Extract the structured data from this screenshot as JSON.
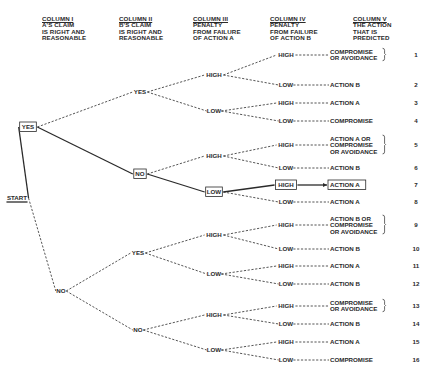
{
  "columns": [
    {
      "title": "COLUMN I",
      "lines": [
        "A'S CLAIM",
        "IS RIGHT AND",
        "REASONABLE"
      ],
      "x": 57
    },
    {
      "title": "COLUMN II",
      "lines": [
        "B'S CLAIM",
        "IS RIGHT AND",
        "REASONABLE"
      ],
      "x": 133
    },
    {
      "title": "COLUMN III",
      "lines": [
        "PENALTY",
        "FROM FAILURE",
        "OF ACTION A"
      ],
      "x": 206
    },
    {
      "title": "COLUMN IV",
      "lines": [
        "PENALTY",
        "FROM FAILURE",
        "OF ACTION B"
      ],
      "x": 286
    },
    {
      "title": "COLUMN V",
      "lines": [
        "THE ACTION",
        "THAT IS",
        "PREDICTED"
      ],
      "x": 354
    }
  ],
  "colors": {
    "ink": "#2a2a2a",
    "background": "#ffffff"
  },
  "nodes": {
    "start": {
      "label": "START",
      "x": 17,
      "y": 198,
      "boxed": false,
      "underline": true
    },
    "c1_yes": {
      "label": "YES",
      "x": 28,
      "y": 127,
      "boxed": true
    },
    "c1_no": {
      "label": "NO",
      "x": 61,
      "y": 291,
      "boxed": false
    },
    "c2_yy": {
      "label": "YES",
      "x": 140,
      "y": 92,
      "boxed": false
    },
    "c2_yn": {
      "label": "NO",
      "x": 140,
      "y": 174,
      "boxed": true
    },
    "c2_ny": {
      "label": "YES",
      "x": 138,
      "y": 253,
      "boxed": false
    },
    "c2_nn": {
      "label": "NO",
      "x": 138,
      "y": 330,
      "boxed": false
    },
    "c3_1": {
      "label": "HIGH",
      "x": 214,
      "y": 75,
      "boxed": false
    },
    "c3_2": {
      "label": "LOW",
      "x": 214,
      "y": 111,
      "boxed": false
    },
    "c3_3": {
      "label": "HIGH",
      "x": 214,
      "y": 156,
      "boxed": false
    },
    "c3_4": {
      "label": "LOW",
      "x": 214,
      "y": 192,
      "boxed": true
    },
    "c3_5": {
      "label": "HIGH",
      "x": 214,
      "y": 235,
      "boxed": false
    },
    "c3_6": {
      "label": "LOW",
      "x": 214,
      "y": 274,
      "boxed": false
    },
    "c3_7": {
      "label": "HIGH",
      "x": 214,
      "y": 315,
      "boxed": false
    },
    "c3_8": {
      "label": "LOW",
      "x": 214,
      "y": 350,
      "boxed": false
    }
  },
  "outcomes": [
    {
      "num": "1",
      "col4": "HIGH",
      "action": [
        "COMPROMISE",
        "OR AVOIDANCE"
      ],
      "brace": true,
      "y": 55,
      "parent": "c3_1"
    },
    {
      "num": "2",
      "col4": "LOW",
      "action": [
        "ACTION B"
      ],
      "brace": false,
      "y": 85,
      "parent": "c3_1"
    },
    {
      "num": "3",
      "col4": "HIGH",
      "action": [
        "ACTION A"
      ],
      "brace": false,
      "y": 103,
      "parent": "c3_2"
    },
    {
      "num": "4",
      "col4": "LOW",
      "action": [
        "COMPROMISE"
      ],
      "brace": false,
      "y": 121,
      "parent": "c3_2"
    },
    {
      "num": "5",
      "col4": "HIGH",
      "action": [
        "ACTION A OR",
        "COMPROMISE",
        "OR AVOIDANCE"
      ],
      "brace": true,
      "y": 145,
      "parent": "c3_3"
    },
    {
      "num": "6",
      "col4": "LOW",
      "action": [
        "ACTION B"
      ],
      "brace": false,
      "y": 168,
      "parent": "c3_3"
    },
    {
      "num": "7",
      "col4": "HIGH",
      "action": [
        "ACTION A"
      ],
      "brace": false,
      "y": 185,
      "parent": "c3_4",
      "highlight": true
    },
    {
      "num": "8",
      "col4": "LOW",
      "action": [
        "ACTION A"
      ],
      "brace": false,
      "y": 202,
      "parent": "c3_4"
    },
    {
      "num": "9",
      "col4": "HIGH",
      "action": [
        "ACTION B OR",
        "COMPROMISE",
        "OR AVOIDANCE"
      ],
      "brace": true,
      "y": 225,
      "parent": "c3_5"
    },
    {
      "num": "10",
      "col4": "LOW",
      "action": [
        "ACTION B"
      ],
      "brace": false,
      "y": 249,
      "parent": "c3_5"
    },
    {
      "num": "11",
      "col4": "HIGH",
      "action": [
        "ACTION A"
      ],
      "brace": false,
      "y": 266,
      "parent": "c3_6"
    },
    {
      "num": "12",
      "col4": "LOW",
      "action": [
        "ACTION B"
      ],
      "brace": false,
      "y": 284,
      "parent": "c3_6"
    },
    {
      "num": "13",
      "col4": "HIGH",
      "action": [
        "COMPROMISE",
        "OR AVOIDANCE"
      ],
      "brace": true,
      "y": 306,
      "parent": "c3_7"
    },
    {
      "num": "14",
      "col4": "LOW",
      "action": [
        "ACTION B"
      ],
      "brace": false,
      "y": 324,
      "parent": "c3_7"
    },
    {
      "num": "15",
      "col4": "HIGH",
      "action": [
        "ACTION A"
      ],
      "brace": false,
      "y": 342,
      "parent": "c3_8"
    },
    {
      "num": "16",
      "col4": "LOW",
      "action": [
        "COMPROMISE"
      ],
      "brace": false,
      "y": 360,
      "parent": "c3_8"
    }
  ],
  "edges": [
    {
      "from": "start",
      "to": "c1_yes",
      "solid": true
    },
    {
      "from": "start",
      "to": "c1_no",
      "solid": false
    },
    {
      "from": "c1_yes",
      "to": "c2_yy",
      "solid": false
    },
    {
      "from": "c1_yes",
      "to": "c2_yn",
      "solid": true
    },
    {
      "from": "c1_no",
      "to": "c2_ny",
      "solid": false
    },
    {
      "from": "c1_no",
      "to": "c2_nn",
      "solid": false
    },
    {
      "from": "c2_yy",
      "to": "c3_1",
      "solid": false
    },
    {
      "from": "c2_yy",
      "to": "c3_2",
      "solid": false
    },
    {
      "from": "c2_yn",
      "to": "c3_3",
      "solid": false
    },
    {
      "from": "c2_yn",
      "to": "c3_4",
      "solid": true
    },
    {
      "from": "c2_ny",
      "to": "c3_5",
      "solid": false
    },
    {
      "from": "c2_ny",
      "to": "c3_6",
      "solid": false
    },
    {
      "from": "c2_nn",
      "to": "c3_7",
      "solid": false
    },
    {
      "from": "c2_nn",
      "to": "c3_8",
      "solid": false
    }
  ],
  "layout": {
    "col4_x": 286,
    "col5_x": 330,
    "num_x": 416
  }
}
